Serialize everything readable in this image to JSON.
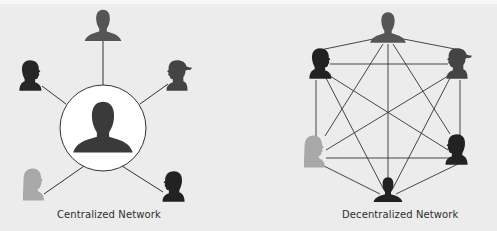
{
  "diagrams": [
    {
      "id": "centralized",
      "caption": "Centralized Network",
      "hub": {
        "cx": 103,
        "cy": 128,
        "r": 43,
        "fill": "#ffffff",
        "figure_color": "#3a3a3a"
      },
      "nodes": [
        {
          "name": "top-person",
          "x": 103,
          "y": 24,
          "type": "man",
          "facing": "front",
          "color": "#555555"
        },
        {
          "name": "top-left-person",
          "x": 33,
          "y": 70,
          "type": "man",
          "facing": "right",
          "color": "#262626"
        },
        {
          "name": "top-right-person",
          "x": 178,
          "y": 70,
          "type": "woman-ponytail",
          "facing": "left",
          "color": "#444444"
        },
        {
          "name": "bottom-left-person",
          "x": 33,
          "y": 178,
          "type": "woman-long-hair",
          "facing": "right",
          "color": "#a8a8a8"
        },
        {
          "name": "bottom-right-person",
          "x": 167,
          "y": 180,
          "type": "man",
          "facing": "left",
          "color": "#222222"
        }
      ]
    },
    {
      "id": "decentralized",
      "caption": "Decentralized Network",
      "nodes": [
        {
          "name": "top-person",
          "x": 388,
          "y": 28,
          "type": "man",
          "facing": "front",
          "color": "#555555"
        },
        {
          "name": "top-left-person",
          "x": 320,
          "y": 63,
          "type": "man",
          "facing": "right",
          "color": "#222222"
        },
        {
          "name": "top-right-person",
          "x": 457,
          "y": 63,
          "type": "woman-ponytail",
          "facing": "left",
          "color": "#444444"
        },
        {
          "name": "left-person",
          "x": 312,
          "y": 152,
          "type": "woman-long-hair",
          "facing": "right",
          "color": "#a8a8a8"
        },
        {
          "name": "right-person",
          "x": 455,
          "y": 150,
          "type": "man",
          "facing": "left",
          "color": "#222222"
        },
        {
          "name": "bottom-person",
          "x": 388,
          "y": 190,
          "type": "man",
          "facing": "front",
          "color": "#222222"
        }
      ],
      "edges": "fully-connected"
    }
  ],
  "colors": {
    "background": "#ececec",
    "line": "#333333",
    "caption_text": "#2e2e2e"
  }
}
